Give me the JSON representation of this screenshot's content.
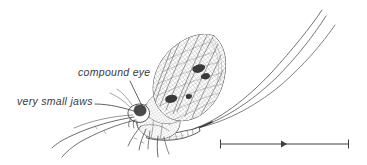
{
  "figure": {
    "name": "mayfly-labelled-diagram",
    "view": "lateral",
    "style": "pen-and-ink scientific illustration",
    "background_color": "#ffffff",
    "ink_color": "#444444",
    "labels": [
      {
        "id": "compound-eye",
        "text": "compound eye",
        "style": "italic",
        "text_x": 78,
        "text_y": 66,
        "leader": {
          "from_x": 130,
          "from_y": 81,
          "to_x": 143,
          "to_y": 108
        }
      },
      {
        "id": "very-small-jaws",
        "text": "very small jaws",
        "style": "italic",
        "text_x": 17,
        "text_y": 95,
        "leader": {
          "from_x": 95,
          "from_y": 104,
          "to_x": 137,
          "to_y": 112
        }
      }
    ],
    "scale_bar": {
      "id": "scale-bar",
      "x1": 220,
      "x2": 349,
      "y": 144,
      "tick_height": 9,
      "arrowhead": {
        "x": 285,
        "y": 144,
        "direction": "right"
      },
      "caption": ""
    },
    "anatomy": {
      "wings": {
        "count": 2,
        "texture": "fine reticulate venation mesh",
        "spots": 3
      },
      "tails": {
        "count": 3,
        "name": "cerci",
        "curve": "sweeping upward to the right"
      },
      "abdomen": {
        "segments": 8
      },
      "legs": {
        "visible": 5,
        "note": "elongated forelegs directed forward-left"
      },
      "head": {
        "features": [
          "compound eye",
          "very small jaws"
        ]
      }
    }
  }
}
